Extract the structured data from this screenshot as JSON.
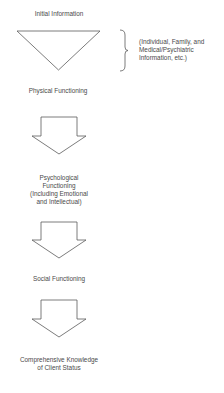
{
  "diagram": {
    "stages": [
      {
        "label": "Initial Information"
      },
      {
        "label": "Physical Functioning"
      },
      {
        "lines": [
          "Psychological",
          "Functioning",
          "(Including Emotional",
          "and Intellectual)"
        ]
      },
      {
        "label": "Social Functioning"
      },
      {
        "lines": [
          "Comprehensive Knowledge",
          "of Client Status"
        ]
      }
    ],
    "bracket_note": {
      "lines": [
        "(Individual, Family, and",
        "Medical/Psychiatric",
        "Information, etc.)"
      ]
    },
    "shapes": {
      "funnel": "inverted-triangle",
      "arrows": [
        "down-arrow",
        "down-arrow",
        "down-arrow"
      ],
      "brace": "right-curly-brace"
    },
    "colors": {
      "stroke": "#5a5a5a",
      "text": "#4a4a4a",
      "background": "#ffffff"
    }
  }
}
